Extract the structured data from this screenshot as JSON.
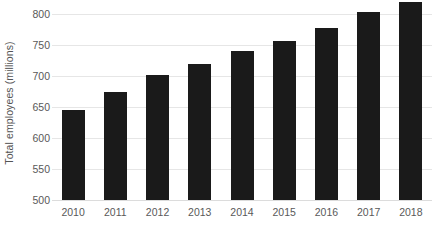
{
  "chart_data": {
    "type": "bar",
    "title": "",
    "subtitle": "",
    "xlabel": "",
    "ylabel": "Total employees (millions)",
    "categories": [
      "2010",
      "2011",
      "2012",
      "2013",
      "2014",
      "2015",
      "2016",
      "2017",
      "2018"
    ],
    "values": [
      645,
      675,
      701,
      719,
      740,
      757,
      777,
      803,
      820
    ],
    "series": [
      {
        "name": "Total employees (millions)",
        "values": [
          645,
          675,
          701,
          719,
          740,
          757,
          777,
          803,
          820
        ]
      }
    ],
    "ylim": [
      500,
      830
    ],
    "y_ticks": [
      500,
      550,
      600,
      650,
      700,
      750,
      800
    ],
    "y_tick_labels": [
      "500",
      "550",
      "600",
      "650",
      "700",
      "750",
      "800"
    ],
    "x_tick_labels": [
      "2010",
      "2011",
      "2012",
      "2013",
      "2014",
      "2015",
      "2016",
      "2017",
      "2018"
    ],
    "grid": true,
    "grid_axis": "y",
    "legend": false,
    "legend_position": "none",
    "bar_color": "#1a1a1a",
    "gridline_color": "#e6e6e6",
    "axis_text_color": "#595959",
    "background_color": "#ffffff",
    "annotations": []
  }
}
